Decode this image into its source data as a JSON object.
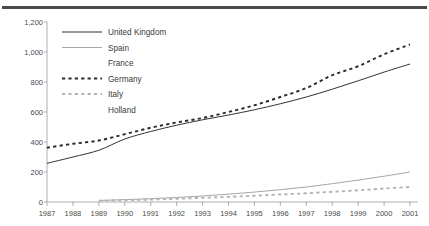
{
  "chart_data": {
    "type": "line",
    "title": "",
    "xlabel": "",
    "ylabel": "",
    "categories": [
      "1987",
      "1988",
      "1989",
      "1990",
      "1991",
      "1992",
      "1993",
      "1994",
      "1995",
      "1996",
      "1997",
      "1998",
      "1999",
      "2000",
      "2001"
    ],
    "ylim": [
      0,
      1200
    ],
    "yticks": [
      "0",
      "200",
      "400",
      "600",
      "800",
      "1,000",
      "1,200"
    ],
    "ytick_values": [
      0,
      200,
      400,
      600,
      800,
      1000,
      1200
    ],
    "grid": false,
    "legend_position": "inside-top-left",
    "series": [
      {
        "name": "United Kingdom",
        "style": "solid",
        "color": "#333333",
        "values": [
          258,
          300,
          345,
          420,
          470,
          512,
          548,
          580,
          615,
          655,
          700,
          752,
          808,
          866,
          920
        ]
      },
      {
        "name": "Spain",
        "style": "solid",
        "color": "#a6a6a6",
        "values": [
          null,
          null,
          10,
          16,
          22,
          30,
          40,
          52,
          66,
          82,
          100,
          122,
          146,
          172,
          200
        ]
      },
      {
        "name": "France",
        "style": "none",
        "color": "#ffffff",
        "values": [
          null,
          null,
          null,
          null,
          null,
          null,
          null,
          null,
          null,
          null,
          null,
          null,
          null,
          null,
          null
        ]
      },
      {
        "name": "Germany",
        "style": "dashed",
        "color": "#2b2b2b",
        "values": [
          362,
          388,
          410,
          452,
          495,
          530,
          560,
          600,
          645,
          700,
          760,
          845,
          905,
          985,
          1050
        ]
      },
      {
        "name": "Italy",
        "style": "dashed",
        "color": "#b4b4b4",
        "values": [
          null,
          null,
          8,
          12,
          16,
          22,
          28,
          34,
          42,
          50,
          58,
          68,
          78,
          90,
          100
        ]
      },
      {
        "name": "Holland",
        "style": "none",
        "color": "#ffffff",
        "values": [
          null,
          null,
          null,
          null,
          null,
          null,
          null,
          null,
          null,
          null,
          null,
          null,
          null,
          null,
          null
        ]
      }
    ],
    "legend_entries": [
      {
        "label": "United Kingdom",
        "style": "solid",
        "color": "#333333"
      },
      {
        "label": "Spain",
        "style": "solid",
        "color": "#a6a6a6"
      },
      {
        "label": "France",
        "style": "none",
        "color": "#ffffff"
      },
      {
        "label": "Germany",
        "style": "dashed",
        "color": "#2b2b2b"
      },
      {
        "label": "Italy",
        "style": "dashed",
        "color": "#b4b4b4"
      },
      {
        "label": "Holland",
        "style": "none",
        "color": "#ffffff"
      }
    ]
  }
}
